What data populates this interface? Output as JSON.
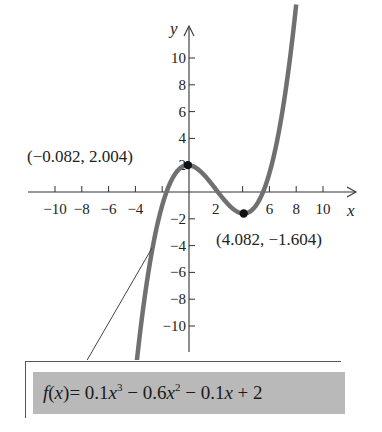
{
  "chart_data": {
    "type": "line",
    "title": "",
    "function": "f(x) = 0.1x^3 - 0.6x^2 - 0.1x + 2",
    "xlabel": "x",
    "ylabel": "y",
    "xlim": [
      -11.5,
      11.5
    ],
    "ylim": [
      -11.5,
      11.5
    ],
    "x_ticks": [
      -10,
      -8,
      -6,
      -4,
      -2,
      2,
      4,
      6,
      8,
      10
    ],
    "x_tick_labels": [
      "−10",
      "−8",
      "−6",
      "−4",
      "",
      "2",
      "",
      "6",
      "8",
      "10"
    ],
    "y_ticks": [
      -10,
      -8,
      -6,
      -4,
      -2,
      2,
      4,
      6,
      8,
      10
    ],
    "y_tick_labels": [
      "−10",
      "−8",
      "−6",
      "−4",
      "−2",
      "2",
      "4",
      "6",
      "8",
      "10"
    ],
    "grid": false,
    "legend": null,
    "series": [
      {
        "name": "f(x)",
        "color": "#707070",
        "x": [
          -4.0,
          -3.0,
          -2.0,
          -1.0,
          -0.082,
          1.0,
          2.0,
          3.0,
          4.082,
          5.0,
          6.0,
          7.0,
          8.0
        ],
        "y": [
          -13.6,
          -6.4,
          -1.0,
          1.6,
          2.004,
          1.4,
          -0.2,
          -1.3,
          -1.604,
          -0.5,
          2.6,
          8.6,
          11.2
        ]
      }
    ],
    "annotations": [
      {
        "label": "(−0.082, 2.004)",
        "x": -0.082,
        "y": 2.004,
        "kind": "relative maximum"
      },
      {
        "label": "(4.082, −1.604)",
        "x": 4.082,
        "y": -1.604,
        "kind": "relative minimum"
      }
    ]
  },
  "labels": {
    "x_axis": "x",
    "y_axis": "y",
    "max_point": "(−0.082, 2.004)",
    "min_point": "(4.082, −1.604)",
    "formula_fx": "f",
    "formula_paren_open": "(",
    "formula_x": "x",
    "formula_paren_close": ")",
    "formula_eq": "= 0.1",
    "formula_x3": "x",
    "formula_exp3": "3",
    "formula_mid1": " − 0.6",
    "formula_x2": "x",
    "formula_exp2": "2",
    "formula_mid2": " − 0.1",
    "formula_x1": "x",
    "formula_end": " + 2"
  },
  "colors": {
    "curve": "#707070",
    "axis": "#333333",
    "point": "#111111",
    "formula_bg": "#b9b9b9"
  }
}
